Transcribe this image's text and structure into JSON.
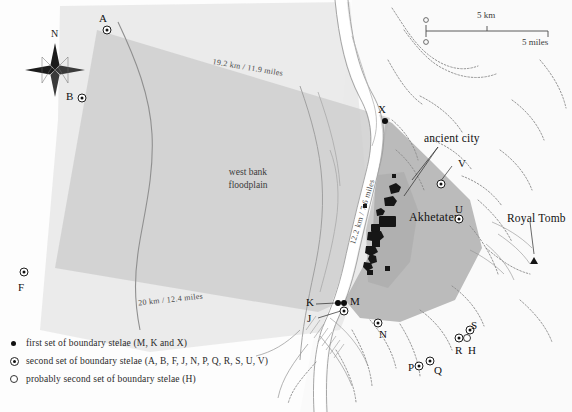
{
  "map": {
    "title": "Akhetaten boundary stelae map",
    "place_labels": [
      {
        "name": "ancient city",
        "text": "ancient city"
      },
      {
        "name": "akhetaten",
        "text": "Akhetaten"
      },
      {
        "name": "royal-tomb",
        "text": "Royal Tomb"
      }
    ],
    "region_label": {
      "line1": "west bank",
      "line2": "floodplain"
    },
    "distances": [
      {
        "name": "north-edge",
        "text": "19.2 km / 11.9 miles"
      },
      {
        "name": "south-edge",
        "text": "20 km / 12.4 miles"
      },
      {
        "name": "east-edge",
        "text": "12.2 km / 7.6 miles"
      }
    ],
    "compass": {
      "north": "N"
    },
    "scale": {
      "zero_km": "0",
      "zero_miles": "0",
      "km_label": "5 km",
      "miles_label": "5 miles"
    },
    "colors": {
      "floodplain": "#d4d4d4",
      "west_polygon": "#c9c9c9",
      "east_territory": "#b9b9b9",
      "nile": "#ffffff",
      "desert": "#fbfbfb",
      "ink": "#111111"
    },
    "stelae": [
      {
        "id": "A",
        "type": "second"
      },
      {
        "id": "B",
        "type": "second"
      },
      {
        "id": "F",
        "type": "second"
      },
      {
        "id": "X",
        "type": "first"
      },
      {
        "id": "V",
        "type": "second"
      },
      {
        "id": "U",
        "type": "second"
      },
      {
        "id": "K",
        "type": "first"
      },
      {
        "id": "J",
        "type": "second"
      },
      {
        "id": "M",
        "type": "first"
      },
      {
        "id": "N",
        "type": "second"
      },
      {
        "id": "P",
        "type": "second"
      },
      {
        "id": "Q",
        "type": "second"
      },
      {
        "id": "R",
        "type": "second"
      },
      {
        "id": "S",
        "type": "second"
      },
      {
        "id": "H",
        "type": "probable-second"
      }
    ]
  },
  "legend": {
    "items": [
      {
        "glyph": "filled-dot",
        "text": "first set of boundary stelae (M, K and X)"
      },
      {
        "glyph": "circled-dot",
        "text": "second set of boundary stelae (A, B, F, J, N, P, Q, R, S, U, V)"
      },
      {
        "glyph": "hollow-circle",
        "text": "probably second set of boundary stelae (H)"
      }
    ]
  }
}
